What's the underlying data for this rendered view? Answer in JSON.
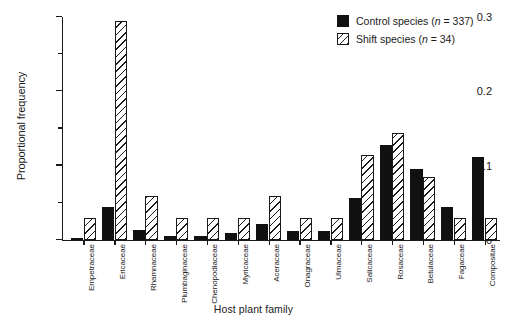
{
  "chart_data": {
    "type": "bar",
    "title": "",
    "xlabel": "Host plant family",
    "ylabel": "Proportional frequency",
    "ylim": [
      0,
      0.3
    ],
    "ytick_labels": [
      "0",
      "0.1",
      "0.2",
      "0.3"
    ],
    "ytick_values": [
      0,
      0.1,
      0.2,
      0.3
    ],
    "yminor_values": [
      0.05,
      0.15,
      0.25
    ],
    "grid": false,
    "legend_position": "top-right",
    "categories": [
      "Empetraceae",
      "Ericaceae",
      "Rhamnaceae",
      "Plumbaginaceae",
      "Chenopodiaceae",
      "Myricaceae",
      "Aceraceae",
      "Onagraceae",
      "Ulmaceae",
      "Salicaceae",
      "Rosaceae",
      "Betulaceae",
      "Fagaceae",
      "Compositae"
    ],
    "series": [
      {
        "name": "Control species",
        "n": 337,
        "fill": "solid-black",
        "color": "#111111",
        "values": [
          0.003,
          0.045,
          0.013,
          0.006,
          0.005,
          0.009,
          0.021,
          0.012,
          0.012,
          0.056,
          0.128,
          0.095,
          0.045,
          0.112
        ]
      },
      {
        "name": "Shift species",
        "n": 34,
        "fill": "diagonal-hatch",
        "color": "#ffffff",
        "values": [
          0.029,
          0.295,
          0.059,
          0.029,
          0.029,
          0.029,
          0.059,
          0.029,
          0.029,
          0.115,
          0.144,
          0.085,
          0.029,
          0.029
        ]
      }
    ]
  },
  "legend": {
    "entries": [
      {
        "label_prefix": "Control species (",
        "symbol": "n",
        "label_suffix": " = 337)",
        "swatch": "solid-black-square"
      },
      {
        "label_prefix": "Shift species (",
        "symbol": "n",
        "label_suffix": " = 34)",
        "swatch": "hatched-square"
      }
    ]
  }
}
